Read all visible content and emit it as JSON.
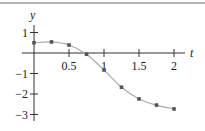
{
  "chart_data": {
    "type": "line",
    "title": "",
    "xlabel": "t",
    "ylabel": "y",
    "x": [
      0,
      0.25,
      0.5,
      0.75,
      1,
      1.25,
      1.5,
      1.75,
      2
    ],
    "series": [
      {
        "name": "y",
        "values": [
          0.5,
          0.54,
          0.39,
          -0.06,
          -0.83,
          -1.67,
          -2.24,
          -2.54,
          -2.73
        ],
        "markers": true
      }
    ],
    "xticks": [
      0.5,
      1,
      1.5,
      2
    ],
    "xtick_labels": [
      "0.5",
      "1",
      "1.5",
      "2"
    ],
    "yticks": [
      1,
      -1,
      -2,
      -3
    ],
    "ytick_labels": [
      "1",
      "−1",
      "−2",
      "−3"
    ],
    "xlim": [
      0,
      2.2
    ],
    "ylim": [
      -3.1,
      1.4
    ],
    "grid": false,
    "legend": null
  },
  "colors": {
    "axis": "#333333",
    "line": "#aaaaaa",
    "marker": "#555555",
    "rule": "#b5b5b5"
  }
}
